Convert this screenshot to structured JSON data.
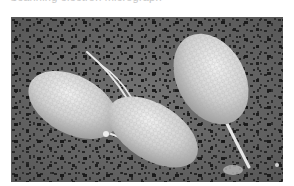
{
  "caption": {
    "text": "Scanning electron micrograph"
  },
  "image": {
    "kind": "scanning-electron-micrograph",
    "subject": "three ovoid flagellated cells with honeycomb-textured surfaces on a porous membrane",
    "cell_count": 3,
    "colors": {
      "background": "#6a6a6a",
      "pores": "#1e1e1e",
      "cell_fill": "#d6d6d6",
      "cell_highlight": "#f2f2f2",
      "cell_shadow": "#9a9a9a",
      "flagella": "#e8e8e8"
    }
  }
}
